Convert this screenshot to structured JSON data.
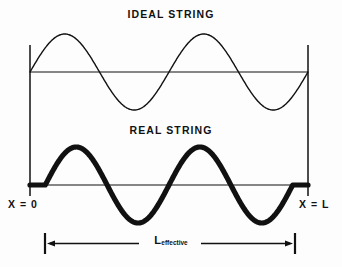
{
  "figure": {
    "width": 342,
    "height": 267,
    "background_color": "#fdfdfd",
    "ink_color": "#111111"
  },
  "titles": {
    "ideal": "IDEAL STRING",
    "real": "REAL STRING"
  },
  "labels": {
    "x_origin": "X = 0",
    "x_end": "X = L",
    "effective_length_main": "L",
    "effective_length_sub": "effective"
  },
  "chart_data": {
    "type": "line",
    "subtitle": "Second harmonic: two full wavelengths across the span",
    "xlabel": "",
    "ylabel": "",
    "grid": false,
    "legend_position": "none",
    "xlim": [
      0,
      1
    ],
    "ylim": [
      -1,
      1
    ],
    "annotations": [
      "X = 0",
      "X = L",
      "L effective",
      "IDEAL STRING",
      "REAL STRING"
    ],
    "series": [
      {
        "name": "IDEAL STRING",
        "panel": "top",
        "line_style": "thin",
        "line_width_px": 1.4,
        "cycles": 2,
        "amplitude_px": 38,
        "baseline_y_px": 72,
        "x_start_px": 30,
        "x_end_px": 308,
        "clamped_at_ends": true,
        "end_flat_fraction": 0.0,
        "description": "Smooth sine wave of two complete cycles anchored at zero on both rigid supports",
        "x": [
          0,
          0.0625,
          0.125,
          0.1875,
          0.25,
          0.3125,
          0.375,
          0.4375,
          0.5,
          0.5625,
          0.625,
          0.6875,
          0.75,
          0.8125,
          0.875,
          0.9375,
          1
        ],
        "values": [
          0,
          0.707,
          1,
          0.707,
          0,
          -0.707,
          -1,
          -0.707,
          0,
          0.707,
          1,
          0.707,
          0,
          -0.707,
          -1,
          -0.707,
          0
        ]
      },
      {
        "name": "REAL STRING",
        "panel": "bottom",
        "line_style": "thick",
        "line_width_px": 5.2,
        "cycles": 2,
        "amplitude_px": 38,
        "baseline_y_px": 185,
        "x_start_px": 30,
        "x_end_px": 308,
        "clamped_at_ends": true,
        "end_flat_fraction": 0.055,
        "description": "Same two-cycle sine but stiffness flattens the wave near each support, so the vibrating portion is shorter than the full span",
        "x": [
          0,
          0.0625,
          0.125,
          0.1875,
          0.25,
          0.3125,
          0.375,
          0.4375,
          0.5,
          0.5625,
          0.625,
          0.6875,
          0.75,
          0.8125,
          0.875,
          0.9375,
          1
        ],
        "values": [
          0,
          0.707,
          1,
          0.707,
          0,
          -0.707,
          -1,
          -0.707,
          0,
          0.707,
          1,
          0.707,
          0,
          -0.707,
          -1,
          -0.707,
          0
        ]
      }
    ],
    "supports": [
      {
        "name": "left-support",
        "x_px": 30,
        "y_top_px": 45,
        "y_bottom_px": 196
      },
      {
        "name": "right-support",
        "x_px": 308,
        "y_top_px": 45,
        "y_bottom_px": 196
      }
    ],
    "dimension": {
      "name": "L effective",
      "x_start_px": 45,
      "x_end_px": 295,
      "y_px": 243,
      "arrow_heads": "both"
    }
  }
}
